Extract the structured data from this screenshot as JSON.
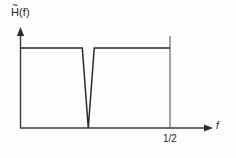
{
  "figure": {
    "kind": "line-plot",
    "background_color": "#fdfdfd",
    "ink_color": "#2b2b2b",
    "y_axis_label_base": "H",
    "y_axis_label_accent": "~",
    "y_axis_label_arg": "(f)",
    "y_axis_label_full": "H~(f)",
    "x_axis_label": "f",
    "x_tick_label": "1/2"
  },
  "chart_data": {
    "type": "line",
    "title": "",
    "subtitle": "",
    "xlabel": "f",
    "ylabel": "H~(f)",
    "grid": false,
    "legend": null,
    "xlim": [
      0,
      0.5
    ],
    "ylim": [
      0,
      1.15
    ],
    "x_ticks": [
      0.5
    ],
    "x_tick_labels": [
      "1/2"
    ],
    "y_ticks": [],
    "y_tick_labels": [],
    "annotations": [
      "Notch (band-stop) frequency response",
      "Passband gain flat at 1",
      "Single zero notch near f = 0.226"
    ],
    "series": [
      {
        "name": "H~(f)",
        "color": "#2b2b2b",
        "x": [
          0.0,
          0.0,
          0.2067,
          0.2267,
          0.2467,
          0.5
        ],
        "values": [
          0.0,
          1.0,
          1.0,
          0.0,
          1.0,
          1.0
        ],
        "description": "Flat passband at unit gain with a deep V-shaped notch dropping to zero"
      }
    ],
    "vertical_marker": {
      "x": 0.5,
      "label": "1/2",
      "y_top": 1.15,
      "y_bottom": 0.0
    }
  }
}
